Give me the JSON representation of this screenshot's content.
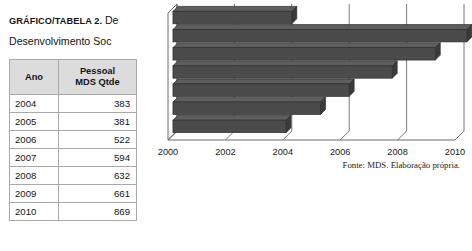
{
  "figure": {
    "caption_strong": "GRÁFICO/TABELA 2.",
    "caption_rest": " De",
    "caption_line2": "Desenvolvimento Soc",
    "source_note": "Fonte: MDS. Elaboração própria."
  },
  "table": {
    "headers": {
      "col1": "Ano",
      "col2_line1": "Pessoal",
      "col2_line2": "MDS Qtde"
    },
    "rows": [
      {
        "ano": "2004",
        "qtde": "383"
      },
      {
        "ano": "2005",
        "qtde": "381"
      },
      {
        "ano": "2006",
        "qtde": "522"
      },
      {
        "ano": "2007",
        "qtde": "594"
      },
      {
        "ano": "2008",
        "qtde": "632"
      },
      {
        "ano": "2009",
        "qtde": "661"
      },
      {
        "ano": "2010",
        "qtde": "869"
      }
    ]
  },
  "chart_data": {
    "type": "bar",
    "orientation": "horizontal",
    "title": "",
    "xlabel": "",
    "ylabel": "",
    "grid": true,
    "legend": null,
    "xlim": [
      2000,
      2010
    ],
    "xticks": [
      "2000",
      "2002",
      "2004",
      "2006",
      "2008",
      "2010"
    ],
    "categories": [
      "9,4",
      "40,6",
      "29,0",
      "27,1",
      "20,3",
      "12,5",
      "11,8"
    ],
    "category_labels_position": "left",
    "bar_end_years": [
      2004.0,
      2010.1,
      2009.0,
      2007.5,
      2006.0,
      2005.0,
      2003.8
    ],
    "values": [
      9.4,
      40.6,
      29.0,
      27.1,
      20.3,
      12.5,
      11.8
    ],
    "bar_color": "#4b4b4b",
    "bar_edge_color": "#2e2e2e",
    "axis_color": "#6b6b6b",
    "background": "#ffffff"
  },
  "axis_labels": {
    "t0": "2000",
    "t1": "2002",
    "t2": "2004",
    "t3": "2006",
    "t4": "2008",
    "t5": "2010"
  }
}
